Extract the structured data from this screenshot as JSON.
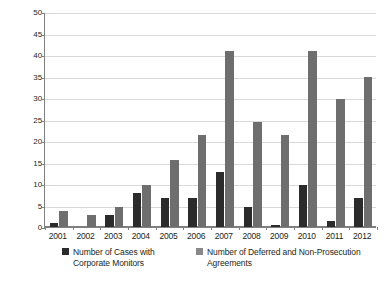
{
  "chart_data": {
    "type": "bar",
    "title": "",
    "subtitle": "",
    "xlabel": "",
    "ylabel": "",
    "ylim": [
      0,
      50
    ],
    "ytick_step": 5,
    "yticks": [
      0,
      5,
      10,
      15,
      20,
      25,
      30,
      35,
      40,
      45,
      50
    ],
    "categories": [
      "2001",
      "2002",
      "2003",
      "2004",
      "2005",
      "2006",
      "2007",
      "2008",
      "2009",
      "2010",
      "2011",
      "2012"
    ],
    "grid": true,
    "legend_position": "bottom",
    "series": [
      {
        "name": "Number of Cases with Corporate Monitors",
        "color": "#2b2b2b",
        "values": [
          1,
          0,
          2.8,
          8,
          6.7,
          6.7,
          12.8,
          4.7,
          0.5,
          9.7,
          1.5,
          6.8
        ]
      },
      {
        "name": "Number of Deferred and Non-Prosecution Agreements",
        "color": "#6e6e6e",
        "values": [
          3.8,
          2.8,
          4.7,
          9.7,
          15.5,
          21.5,
          41,
          24.5,
          21.5,
          41,
          29.8,
          35
        ]
      }
    ]
  },
  "legend": {
    "entries": [
      {
        "label": "Number of Cases with\nCorporate Monitors",
        "swatch": "black"
      },
      {
        "label": "Number of Deferred and Non-Prosecution\nAgreements",
        "swatch": "gray"
      }
    ]
  },
  "colors": {
    "series_black": "#2b2b2b",
    "series_gray": "#6e6e6e",
    "gridline": "#d9d9d9",
    "axis": "#808080",
    "text": "#231f20",
    "background": "#ffffff"
  }
}
